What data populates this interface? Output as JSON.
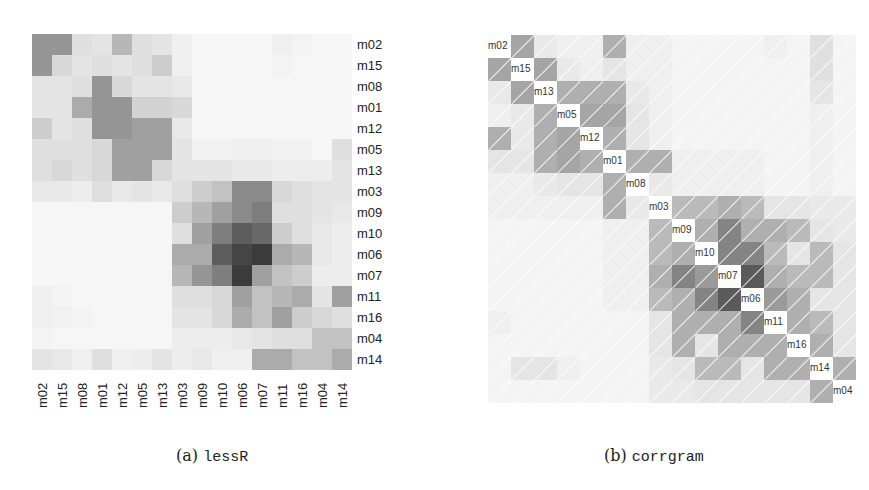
{
  "chart_data": [
    {
      "type": "heatmap",
      "title": "",
      "caption_label": "(a)",
      "caption_name": "lessR",
      "row_labels": [
        "m02",
        "m15",
        "m08",
        "m01",
        "m12",
        "m05",
        "m13",
        "m03",
        "m09",
        "m10",
        "m06",
        "m07",
        "m11",
        "m16",
        "m04",
        "m14"
      ],
      "col_labels": [
        "m02",
        "m15",
        "m08",
        "m01",
        "m12",
        "m05",
        "m13",
        "m03",
        "m09",
        "m10",
        "m06",
        "m07",
        "m11",
        "m16",
        "m04",
        "m14"
      ],
      "values": [
        [
          0.45,
          0.45,
          0.12,
          0.1,
          0.3,
          0.12,
          0.1,
          0.05,
          0.02,
          0.02,
          0.02,
          0.02,
          0.05,
          0.03,
          0.02,
          0.02
        ],
        [
          0.45,
          0.15,
          0.1,
          0.12,
          0.1,
          0.12,
          0.2,
          0.05,
          0.02,
          0.02,
          0.02,
          0.02,
          0.03,
          0.02,
          0.02,
          0.02
        ],
        [
          0.1,
          0.1,
          0.12,
          0.45,
          0.15,
          0.1,
          0.1,
          0.08,
          0.02,
          0.02,
          0.02,
          0.02,
          0.02,
          0.02,
          0.02,
          0.02
        ],
        [
          0.1,
          0.1,
          0.35,
          0.45,
          0.45,
          0.18,
          0.18,
          0.15,
          0.02,
          0.02,
          0.02,
          0.02,
          0.02,
          0.02,
          0.02,
          0.02
        ],
        [
          0.2,
          0.1,
          0.12,
          0.45,
          0.45,
          0.4,
          0.4,
          0.08,
          0.02,
          0.02,
          0.02,
          0.02,
          0.02,
          0.02,
          0.02,
          0.02
        ],
        [
          0.12,
          0.12,
          0.12,
          0.15,
          0.4,
          0.4,
          0.4,
          0.1,
          0.04,
          0.04,
          0.05,
          0.05,
          0.04,
          0.04,
          0.02,
          0.12
        ],
        [
          0.12,
          0.15,
          0.12,
          0.15,
          0.4,
          0.4,
          0.15,
          0.1,
          0.1,
          0.1,
          0.08,
          0.08,
          0.06,
          0.06,
          0.06,
          0.1
        ],
        [
          0.08,
          0.08,
          0.06,
          0.12,
          0.08,
          0.1,
          0.08,
          0.12,
          0.2,
          0.25,
          0.5,
          0.5,
          0.15,
          0.12,
          0.1,
          0.1
        ],
        [
          0.02,
          0.02,
          0.02,
          0.02,
          0.02,
          0.02,
          0.02,
          0.2,
          0.3,
          0.4,
          0.5,
          0.55,
          0.12,
          0.12,
          0.1,
          0.08
        ],
        [
          0.02,
          0.02,
          0.02,
          0.02,
          0.02,
          0.02,
          0.02,
          0.12,
          0.4,
          0.55,
          0.7,
          0.65,
          0.2,
          0.12,
          0.08,
          0.06
        ],
        [
          0.02,
          0.02,
          0.02,
          0.02,
          0.02,
          0.02,
          0.02,
          0.35,
          0.35,
          0.7,
          0.8,
          0.85,
          0.35,
          0.3,
          0.08,
          0.06
        ],
        [
          0.02,
          0.02,
          0.02,
          0.02,
          0.02,
          0.02,
          0.02,
          0.3,
          0.45,
          0.55,
          0.85,
          0.4,
          0.25,
          0.2,
          0.06,
          0.06
        ],
        [
          0.05,
          0.03,
          0.02,
          0.02,
          0.02,
          0.02,
          0.02,
          0.12,
          0.12,
          0.15,
          0.4,
          0.25,
          0.3,
          0.35,
          0.1,
          0.4
        ],
        [
          0.05,
          0.04,
          0.03,
          0.02,
          0.02,
          0.02,
          0.02,
          0.1,
          0.1,
          0.15,
          0.35,
          0.25,
          0.4,
          0.2,
          0.15,
          0.12
        ],
        [
          0.03,
          0.02,
          0.02,
          0.02,
          0.02,
          0.02,
          0.02,
          0.06,
          0.06,
          0.06,
          0.08,
          0.1,
          0.12,
          0.12,
          0.25,
          0.25
        ],
        [
          0.1,
          0.08,
          0.05,
          0.12,
          0.05,
          0.06,
          0.1,
          0.06,
          0.08,
          0.05,
          0.05,
          0.35,
          0.35,
          0.25,
          0.25,
          0.35
        ]
      ],
      "color_scale": {
        "low": "#ffffff",
        "high": "#1a1a1a"
      },
      "grid": false,
      "legend": "none"
    },
    {
      "type": "heatmap",
      "title": "",
      "caption_label": "(b)",
      "caption_name": "corrgram",
      "labels": [
        "m02",
        "m15",
        "m13",
        "m05",
        "m12",
        "m01",
        "m08",
        "m03",
        "m09",
        "m10",
        "m07",
        "m06",
        "m11",
        "m16",
        "m14",
        "m04"
      ],
      "diagonal": "labels",
      "cell_style": "shade with white diagonal slash",
      "values": [
        [
          1,
          0.4,
          0.08,
          0.05,
          0.05,
          0.35,
          0.05,
          0.05,
          0.03,
          0.03,
          0.03,
          0.03,
          0.05,
          0.03,
          0.12,
          0.03
        ],
        [
          0.4,
          1,
          0.4,
          0.08,
          0.05,
          0.1,
          0.05,
          0.05,
          0.03,
          0.03,
          0.03,
          0.03,
          0.03,
          0.03,
          0.12,
          0.03
        ],
        [
          0.08,
          0.4,
          1,
          0.35,
          0.35,
          0.35,
          0.08,
          0.05,
          0.03,
          0.03,
          0.03,
          0.03,
          0.03,
          0.03,
          0.1,
          0.03
        ],
        [
          0.05,
          0.08,
          0.35,
          1,
          0.4,
          0.4,
          0.1,
          0.05,
          0.03,
          0.03,
          0.03,
          0.03,
          0.03,
          0.03,
          0.05,
          0.03
        ],
        [
          0.35,
          0.08,
          0.35,
          0.4,
          1,
          0.35,
          0.1,
          0.05,
          0.03,
          0.03,
          0.03,
          0.03,
          0.03,
          0.03,
          0.05,
          0.03
        ],
        [
          0.1,
          0.1,
          0.35,
          0.4,
          0.35,
          1,
          0.35,
          0.35,
          0.05,
          0.05,
          0.05,
          0.05,
          0.03,
          0.03,
          0.05,
          0.03
        ],
        [
          0.05,
          0.05,
          0.08,
          0.1,
          0.1,
          0.35,
          1,
          0.08,
          0.05,
          0.05,
          0.05,
          0.05,
          0.03,
          0.03,
          0.05,
          0.03
        ],
        [
          0.05,
          0.05,
          0.05,
          0.05,
          0.05,
          0.35,
          0.08,
          1,
          0.3,
          0.3,
          0.35,
          0.3,
          0.1,
          0.1,
          0.08,
          0.08
        ],
        [
          0.03,
          0.03,
          0.03,
          0.03,
          0.03,
          0.05,
          0.05,
          0.3,
          1,
          0.35,
          0.55,
          0.35,
          0.35,
          0.3,
          0.1,
          0.08
        ],
        [
          0.03,
          0.03,
          0.03,
          0.03,
          0.03,
          0.05,
          0.05,
          0.3,
          0.35,
          1,
          0.55,
          0.55,
          0.3,
          0.1,
          0.3,
          0.1
        ],
        [
          0.03,
          0.03,
          0.03,
          0.03,
          0.03,
          0.05,
          0.05,
          0.35,
          0.55,
          0.45,
          1,
          0.75,
          0.35,
          0.3,
          0.3,
          0.1
        ],
        [
          0.03,
          0.03,
          0.03,
          0.03,
          0.03,
          0.05,
          0.05,
          0.3,
          0.35,
          0.55,
          0.75,
          1,
          0.45,
          0.35,
          0.1,
          0.1
        ],
        [
          0.05,
          0.03,
          0.03,
          0.03,
          0.03,
          0.03,
          0.03,
          0.1,
          0.35,
          0.35,
          0.35,
          0.55,
          1,
          0.35,
          0.3,
          0.1
        ],
        [
          0.03,
          0.03,
          0.03,
          0.03,
          0.03,
          0.03,
          0.03,
          0.1,
          0.35,
          0.1,
          0.35,
          0.35,
          0.35,
          1,
          0.35,
          0.1
        ],
        [
          0.03,
          0.1,
          0.1,
          0.05,
          0.03,
          0.03,
          0.03,
          0.08,
          0.1,
          0.3,
          0.3,
          0.1,
          0.35,
          0.35,
          1,
          0.35
        ],
        [
          0.03,
          0.03,
          0.03,
          0.03,
          0.03,
          0.03,
          0.03,
          0.08,
          0.08,
          0.1,
          0.1,
          0.1,
          0.1,
          0.1,
          0.35,
          1
        ]
      ],
      "color_scale": {
        "low": "#ffffff",
        "high": "#1a1a1a"
      },
      "grid": false,
      "legend": "none"
    }
  ],
  "captions": {
    "a_label": "(a)",
    "a_name": "lessR",
    "b_label": "(b)",
    "b_name": "corrgram"
  }
}
